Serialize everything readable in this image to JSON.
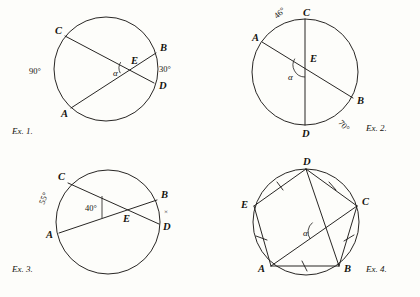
{
  "page": {
    "background_color": "#fdfdfa",
    "ink_color": "#1c1a18",
    "figure_count": 4
  },
  "figures": [
    {
      "id": "ex1",
      "caption": "Ex. 1.",
      "caption_x": 12,
      "caption_y": 134,
      "circle": {
        "cx": 106,
        "cy": 69,
        "r": 52
      },
      "points": {
        "A": {
          "x": 71,
          "y": 108,
          "label_x": 61,
          "label_y": 117
        },
        "B": {
          "x": 156,
          "y": 53,
          "label_x": 160,
          "label_y": 51
        },
        "C": {
          "x": 65,
          "y": 36,
          "label_x": 55,
          "label_y": 34
        },
        "D": {
          "x": 154,
          "y": 83,
          "label_x": 159,
          "label_y": 89
        },
        "E": {
          "x": 130,
          "y": 68,
          "label_x": 131,
          "label_y": 64
        }
      },
      "chords": [
        {
          "from": "C",
          "to": "D",
          "name": "chord-cd"
        },
        {
          "from": "A",
          "to": "B",
          "name": "chord-ab"
        }
      ],
      "angle_marks": [
        {
          "name": "alpha-arc",
          "cx": 130,
          "cy": 68,
          "r": 11,
          "a0": 152,
          "a1": 212
        }
      ],
      "labels": [
        {
          "name": "arc-label-90",
          "text": "90°",
          "x": 29,
          "y": 74,
          "rotate": 0
        },
        {
          "name": "arc-label-30",
          "text": "30°",
          "x": 159,
          "y": 72,
          "rotate": 0
        },
        {
          "name": "alpha-label",
          "text": "α",
          "x": 113,
          "y": 76,
          "rotate": 0
        }
      ]
    },
    {
      "id": "ex2",
      "caption": "Ex. 2.",
      "caption_x": 366,
      "caption_y": 131,
      "circle": {
        "cx": 305,
        "cy": 72,
        "r": 53
      },
      "points": {
        "A": {
          "x": 262,
          "y": 42,
          "label_x": 252,
          "label_y": 41
        },
        "B": {
          "x": 353,
          "y": 98,
          "label_x": 357,
          "label_y": 104
        },
        "C": {
          "x": 305,
          "y": 19,
          "label_x": 303,
          "label_y": 16
        },
        "D": {
          "x": 305,
          "y": 125,
          "label_x": 302,
          "label_y": 137
        },
        "E": {
          "x": 305,
          "y": 65,
          "label_x": 310,
          "label_y": 62
        }
      },
      "chords": [
        {
          "from": "C",
          "to": "D",
          "name": "diameter-cd"
        },
        {
          "from": "A",
          "to": "B",
          "name": "chord-ab"
        }
      ],
      "angle_marks": [
        {
          "name": "alpha-arc",
          "cx": 305,
          "cy": 65,
          "r": 12,
          "a0": 90,
          "a1": 212
        }
      ],
      "labels": [
        {
          "name": "arc-label-46",
          "text": "46°",
          "x": 277,
          "y": 19,
          "rotate": -42
        },
        {
          "name": "arc-label-70",
          "text": "70°",
          "x": 338,
          "y": 123,
          "rotate": 48
        },
        {
          "name": "alpha-label",
          "text": "α",
          "x": 288,
          "y": 80,
          "rotate": 0
        }
      ]
    },
    {
      "id": "ex3",
      "caption": "Ex. 3.",
      "caption_x": 12,
      "caption_y": 272,
      "circle": {
        "cx": 108,
        "cy": 222,
        "r": 52
      },
      "points": {
        "A": {
          "x": 59,
          "y": 233,
          "label_x": 46,
          "label_y": 238
        },
        "B": {
          "x": 157,
          "y": 200,
          "label_x": 161,
          "label_y": 198
        },
        "C": {
          "x": 68,
          "y": 183,
          "label_x": 58,
          "label_y": 180
        },
        "D": {
          "x": 159,
          "y": 224,
          "label_x": 163,
          "label_y": 230
        },
        "E": {
          "x": 127,
          "y": 214,
          "label_x": 123,
          "label_y": 222
        }
      },
      "chords": [
        {
          "from": "C",
          "to": "D",
          "name": "chord-cd"
        },
        {
          "from": "A",
          "to": "B",
          "name": "chord-ab"
        }
      ],
      "angle_marks": [
        {
          "name": "angle-bracket-40",
          "path": "M 102 196 L 102 218"
        }
      ],
      "labels": [
        {
          "name": "arc-label-55",
          "text": "55°",
          "x": 44,
          "y": 205,
          "rotate": -68
        },
        {
          "name": "angle-label-40",
          "text": "40°",
          "x": 85,
          "y": 211,
          "rotate": 0
        },
        {
          "name": "arc-mark-x",
          "text": "×",
          "x": 164,
          "y": 214,
          "rotate": 0
        }
      ]
    },
    {
      "id": "ex4",
      "caption": "Ex. 4.",
      "caption_x": 366,
      "caption_y": 272,
      "circle": {
        "cx": 306,
        "cy": 222,
        "r": 53
      },
      "points": {
        "A": {
          "x": 271,
          "y": 266,
          "label_x": 258,
          "label_y": 272
        },
        "B": {
          "x": 339,
          "y": 266,
          "label_x": 344,
          "label_y": 272
        },
        "C": {
          "x": 357,
          "y": 206,
          "label_x": 362,
          "label_y": 205
        },
        "D": {
          "x": 306,
          "y": 169,
          "label_x": 303,
          "label_y": 165
        },
        "E": {
          "x": 254,
          "y": 206,
          "label_x": 241,
          "label_y": 208
        }
      },
      "polygon_sides": [
        {
          "from": "A",
          "to": "B",
          "name": "side-ab"
        },
        {
          "from": "B",
          "to": "C",
          "name": "side-bc"
        },
        {
          "from": "C",
          "to": "D",
          "name": "side-cd"
        },
        {
          "from": "D",
          "to": "E",
          "name": "side-de"
        },
        {
          "from": "E",
          "to": "A",
          "name": "side-ea"
        }
      ],
      "diagonals": [
        {
          "from": "D",
          "to": "B",
          "name": "diagonal-db"
        },
        {
          "from": "A",
          "to": "C",
          "name": "diagonal-ac"
        }
      ],
      "tick_marks": [
        {
          "name": "tick-ab",
          "x1": 302,
          "y1": 261,
          "x2": 307,
          "y2": 271
        },
        {
          "name": "tick-bc",
          "x1": 344,
          "y1": 241,
          "x2": 354,
          "y2": 235
        },
        {
          "name": "tick-cd",
          "x1": 329,
          "y1": 182,
          "x2": 336,
          "y2": 190
        },
        {
          "name": "tick-de",
          "x1": 277,
          "y1": 182,
          "x2": 283,
          "y2": 190
        },
        {
          "name": "tick-ea",
          "x1": 256,
          "y1": 236,
          "x2": 267,
          "y2": 240
        }
      ],
      "angle_marks": [
        {
          "name": "alpha-arc",
          "cx": 320,
          "cy": 232,
          "r": 12,
          "a0": 144,
          "a1": 232
        }
      ],
      "labels": [
        {
          "name": "alpha-label",
          "text": "α",
          "x": 303,
          "y": 236,
          "rotate": 0
        }
      ]
    }
  ]
}
